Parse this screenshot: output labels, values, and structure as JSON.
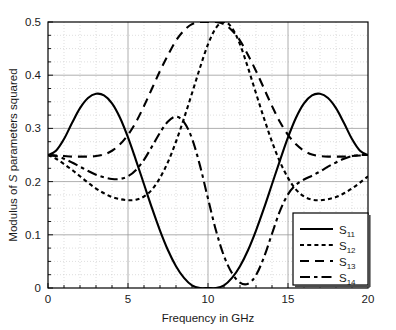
{
  "figure": {
    "background_color": "#ffffff",
    "axis_color": "#000000",
    "grid_major_color": "#9a9a9a",
    "grid_minor_color": "#c8c8c8",
    "curve_color": "#000000"
  },
  "axes": {
    "xlabel": "Frequency in GHz",
    "ylabel_prefix": "Modulus of ",
    "ylabel_italic": "S",
    "ylabel_suffix": " parameters squared",
    "ylabel_full": "Modulus of S parameters squared",
    "x_ticks": [
      "0",
      "5",
      "10",
      "15",
      "20"
    ],
    "y_ticks": [
      "0",
      "0.1",
      "0.2",
      "0.3",
      "0.4",
      "0.5"
    ]
  },
  "legend": {
    "items": [
      {
        "base": "S",
        "sub": "11",
        "style": "solid"
      },
      {
        "base": "S",
        "sub": "12",
        "style": "dotted"
      },
      {
        "base": "S",
        "sub": "13",
        "style": "dashed"
      },
      {
        "base": "S",
        "sub": "14",
        "style": "dashdot"
      }
    ]
  },
  "chart_data": {
    "type": "line",
    "title": "",
    "xlabel": "Frequency in GHz",
    "ylabel": "Modulus of S parameters squared",
    "xlim": [
      0,
      20
    ],
    "ylim": [
      0,
      0.5
    ],
    "x_major_ticks": [
      0,
      5,
      10,
      15,
      20
    ],
    "x_minor_step": 1,
    "y_major_ticks": [
      0,
      0.1,
      0.2,
      0.3,
      0.4,
      0.5
    ],
    "y_minor_step": 0.025,
    "grid": true,
    "grid_minor": true,
    "legend_position": "lower right",
    "x": [
      0,
      0.5,
      1,
      1.5,
      2,
      2.5,
      3,
      3.5,
      4,
      4.5,
      5,
      5.5,
      6,
      6.5,
      7,
      7.5,
      8,
      8.5,
      9,
      9.5,
      10,
      10.5,
      11,
      11.5,
      12,
      12.5,
      13,
      13.5,
      14,
      14.5,
      15,
      15.5,
      16,
      16.5,
      17,
      17.5,
      18,
      18.5,
      19,
      19.5,
      20
    ],
    "series": [
      {
        "name": "S11",
        "label": "S_11",
        "style": "solid",
        "values": [
          0.25,
          0.258,
          0.28,
          0.31,
          0.338,
          0.357,
          0.365,
          0.362,
          0.347,
          0.32,
          0.283,
          0.24,
          0.195,
          0.15,
          0.108,
          0.071,
          0.041,
          0.019,
          0.005,
          0.0,
          0.0,
          0.0,
          0.005,
          0.019,
          0.041,
          0.071,
          0.108,
          0.15,
          0.195,
          0.24,
          0.283,
          0.32,
          0.347,
          0.362,
          0.365,
          0.357,
          0.338,
          0.31,
          0.28,
          0.258,
          0.25
        ]
      },
      {
        "name": "S12",
        "label": "S_12",
        "style": "dotted",
        "values": [
          0.25,
          0.243,
          0.233,
          0.222,
          0.21,
          0.198,
          0.187,
          0.178,
          0.171,
          0.167,
          0.165,
          0.166,
          0.172,
          0.185,
          0.207,
          0.237,
          0.275,
          0.319,
          0.366,
          0.414,
          0.458,
          0.489,
          0.5,
          0.489,
          0.458,
          0.414,
          0.366,
          0.319,
          0.275,
          0.237,
          0.207,
          0.185,
          0.172,
          0.166,
          0.165,
          0.167,
          0.171,
          0.178,
          0.187,
          0.198,
          0.21
        ]
      },
      {
        "name": "S13",
        "label": "S_13",
        "style": "dashed",
        "values": [
          0.25,
          0.249,
          0.248,
          0.247,
          0.247,
          0.247,
          0.248,
          0.251,
          0.258,
          0.27,
          0.288,
          0.312,
          0.342,
          0.375,
          0.408,
          0.438,
          0.465,
          0.484,
          0.496,
          0.5,
          0.5,
          0.5,
          0.496,
          0.484,
          0.465,
          0.438,
          0.408,
          0.375,
          0.342,
          0.312,
          0.288,
          0.27,
          0.258,
          0.251,
          0.248,
          0.247,
          0.247,
          0.247,
          0.248,
          0.249,
          0.25
        ]
      },
      {
        "name": "S14",
        "label": "S_14",
        "style": "dashdot",
        "values": [
          0.25,
          0.248,
          0.243,
          0.236,
          0.228,
          0.22,
          0.213,
          0.208,
          0.205,
          0.205,
          0.21,
          0.222,
          0.241,
          0.266,
          0.292,
          0.313,
          0.322,
          0.312,
          0.281,
          0.23,
          0.168,
          0.108,
          0.06,
          0.028,
          0.01,
          0.008,
          0.024,
          0.058,
          0.102,
          0.145,
          0.176,
          0.194,
          0.204,
          0.211,
          0.219,
          0.228,
          0.236,
          0.243,
          0.248,
          0.25,
          0.25
        ]
      }
    ],
    "annotations": {
      "convergence_value": 0.25,
      "center_frequency_ghz": 10,
      "s11_peak": 0.365,
      "s11_peak_freq_ghz": 4.7,
      "s12_min": 0.165,
      "s12_min_freq_ghz": 5.5,
      "s12_max": 0.5,
      "s13_max": 0.5,
      "s11_min": 0.0
    }
  }
}
